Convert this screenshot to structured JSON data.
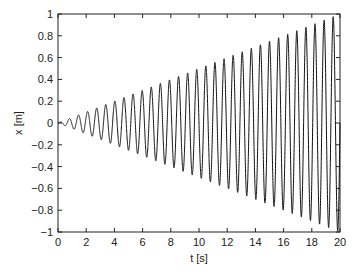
{
  "chart_data": {
    "type": "line",
    "title": "",
    "xlabel": "t [s]",
    "ylabel": "x [m]",
    "xlim": [
      0,
      20
    ],
    "ylim": [
      -1,
      1
    ],
    "xticks": [
      "0",
      "2",
      "4",
      "6",
      "8",
      "10",
      "12",
      "14",
      "16",
      "18",
      "20"
    ],
    "yticks": [
      "1",
      "0.8",
      "0.6",
      "0.4",
      "0.2",
      "0",
      "−0.2",
      "−0.4",
      "−0.6",
      "−0.8",
      "−1"
    ],
    "grid": false,
    "legend": null,
    "series": [
      {
        "name": "x(t)",
        "description": "sinusoid with linearly growing amplitude, x = (t/20)·sin(2π·f·t)",
        "frequency_hz": 1.55,
        "amplitude_at_t20": 1.0,
        "color": "#000000",
        "sample_envelope": {
          "t": [
            0,
            5,
            10,
            15,
            20
          ],
          "amplitude": [
            0,
            0.25,
            0.5,
            0.75,
            1.0
          ]
        }
      }
    ]
  }
}
